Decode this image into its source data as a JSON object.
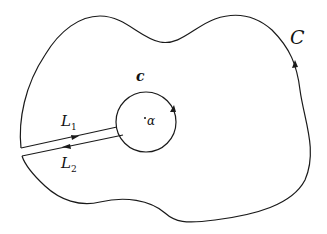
{
  "diagram": {
    "type": "contour-integration",
    "outer_contour": {
      "label": "C",
      "orientation": "counterclockwise"
    },
    "inner_contour": {
      "label": "c",
      "orientation": "counterclockwise",
      "center_label": "α"
    },
    "cut_lines": [
      {
        "label": "L",
        "subscript": "1",
        "direction": "toward-inner-circle"
      },
      {
        "label": "L",
        "subscript": "2",
        "direction": "toward-outer-contour"
      }
    ],
    "colors": {
      "stroke": "#1a1a1a",
      "background": "#ffffff"
    }
  }
}
